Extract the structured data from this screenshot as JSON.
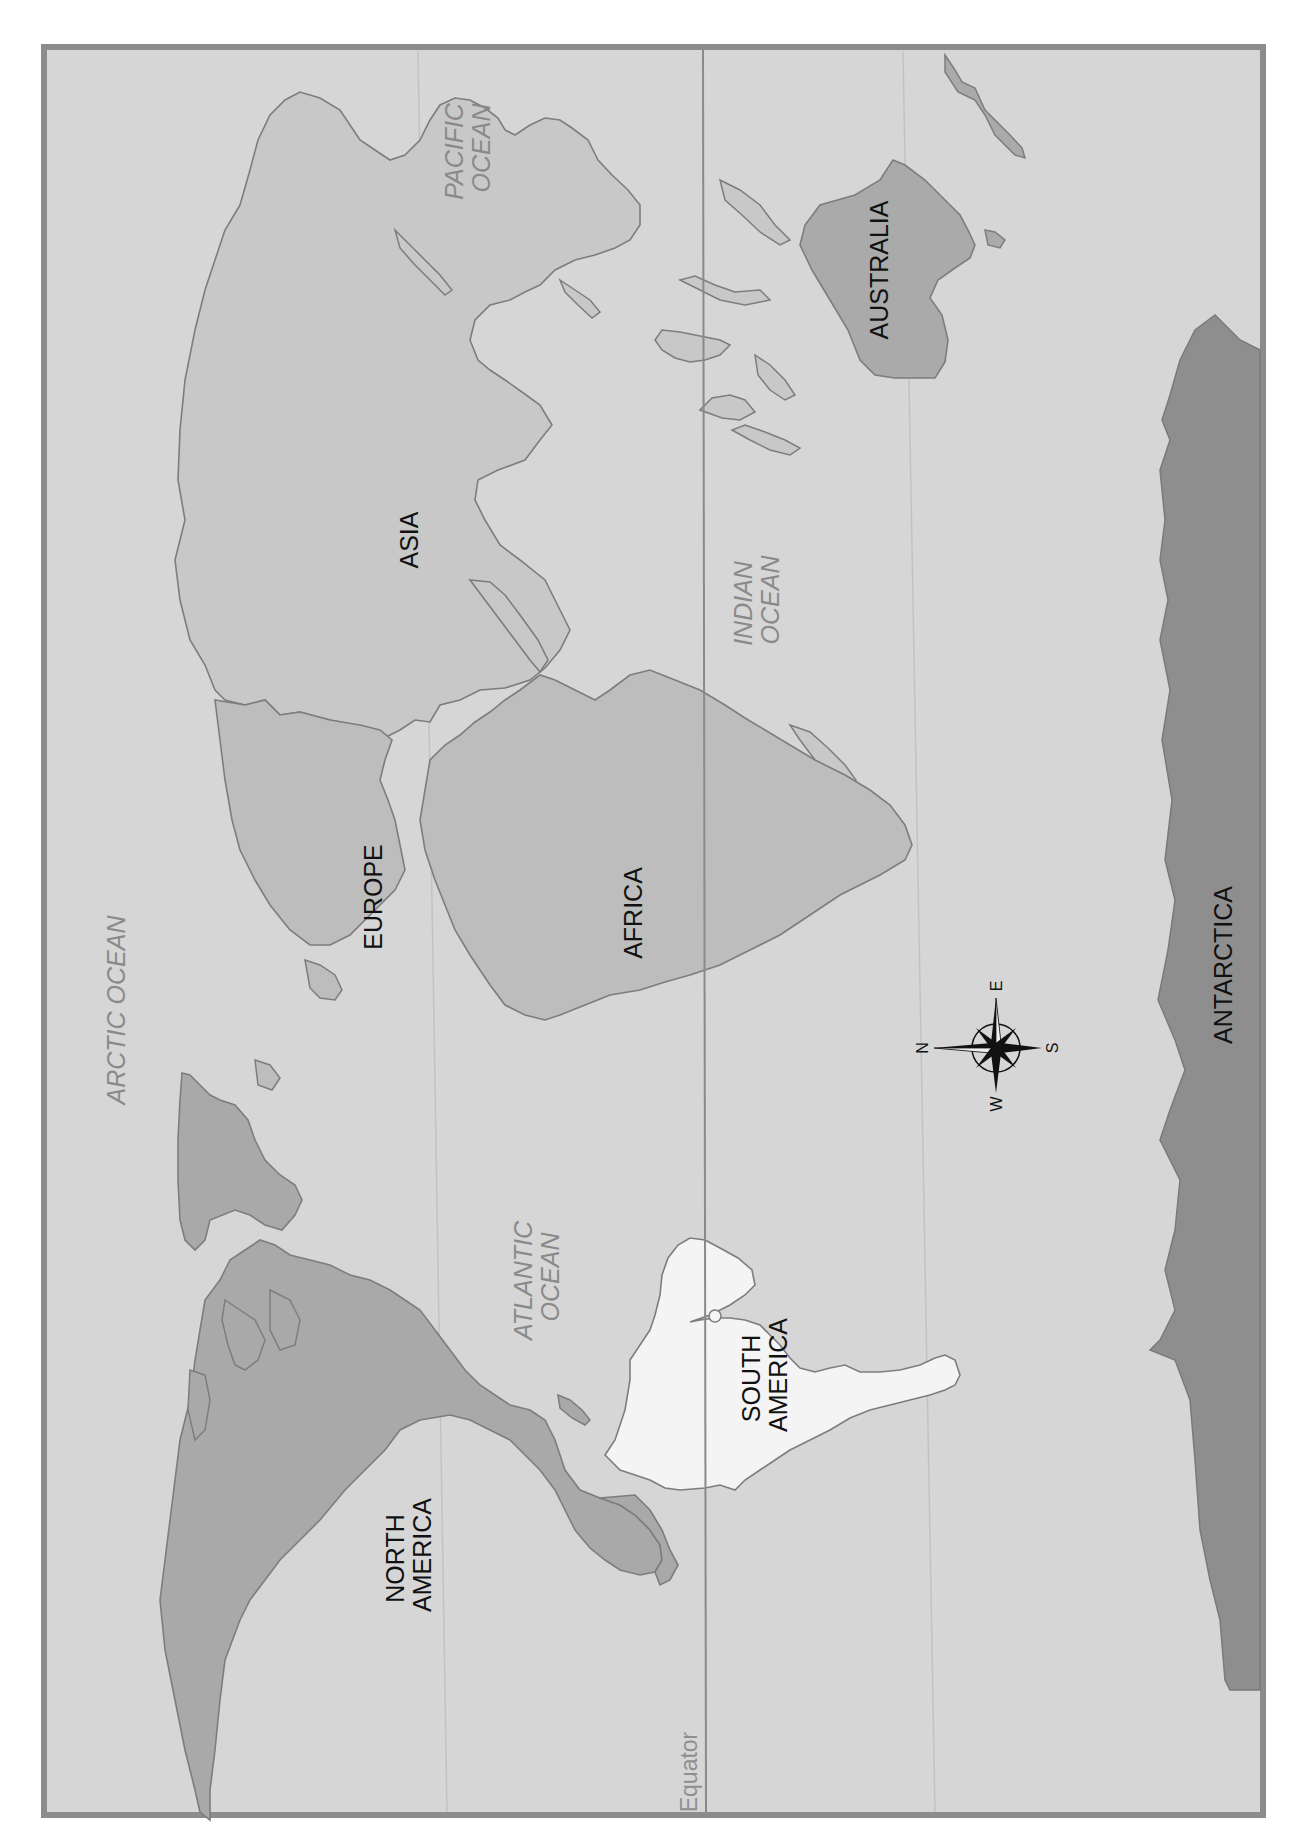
{
  "map": {
    "orientation": "rotated 90 degrees clockwise (north to the left)",
    "colors": {
      "page_background": "#ffffff",
      "frame": "#8c8c8c",
      "ocean": "#d6d6d6",
      "land_light": "#c8c8c8",
      "land_medium": "#bdbdbd",
      "land_dark": "#a9a9a9",
      "antarctica": "#8e8e8e",
      "south_america": "#f4f4f4",
      "coastline": "#7d7d7d",
      "equator_line": "#8a8a8a",
      "tropic_line": "#c2c2c2",
      "continent_label": "#111111",
      "ocean_label": "#8a8a8a"
    },
    "continents": [
      {
        "id": "north_america",
        "lines": [
          "NORTH",
          "AMERICA"
        ]
      },
      {
        "id": "south_america",
        "lines": [
          "SOUTH",
          "AMERICA"
        ]
      },
      {
        "id": "europe",
        "lines": [
          "EUROPE"
        ]
      },
      {
        "id": "africa",
        "lines": [
          "AFRICA"
        ]
      },
      {
        "id": "asia",
        "lines": [
          "ASIA"
        ]
      },
      {
        "id": "australia",
        "lines": [
          "AUSTRALIA"
        ]
      },
      {
        "id": "antarctica",
        "lines": [
          "ANTARCTICA"
        ]
      }
    ],
    "oceans": [
      {
        "id": "arctic",
        "lines": [
          "ARCTIC OCEAN"
        ]
      },
      {
        "id": "atlantic",
        "lines": [
          "ATLANTIC",
          "OCEAN"
        ]
      },
      {
        "id": "pacific",
        "lines": [
          "PACIFIC",
          "OCEAN"
        ]
      },
      {
        "id": "indian",
        "lines": [
          "INDIAN",
          "OCEAN"
        ]
      }
    ],
    "equator_label": "Equator",
    "compass": {
      "n": "N",
      "e": "E",
      "s": "S",
      "w": "W"
    }
  }
}
